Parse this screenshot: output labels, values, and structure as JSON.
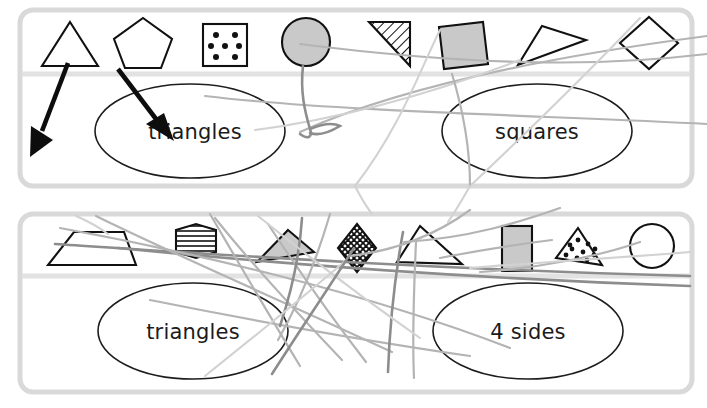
{
  "activity": {
    "title": "Shape sorting activity",
    "panel_count": 2,
    "colors": {
      "panel_border": "#d9d9d9",
      "panel_divider": "#e2e2e2",
      "shape_outline": "#111111",
      "shape_fill_gray": "#c9c9c9",
      "zone_outline": "#1d1d1d",
      "drag_trail": "#b4b4b4",
      "arrow": "#0d0d0d",
      "background": "#ffffff",
      "label_text": "#1b1b1b"
    }
  },
  "panels": [
    {
      "id": "panel-top",
      "shape_tray": {
        "name": "shape-tray-top",
        "shapes": [
          {
            "name": "triangle",
            "fill": "white",
            "pattern": "none"
          },
          {
            "name": "pentagon",
            "fill": "white",
            "pattern": "none"
          },
          {
            "name": "square-dotted",
            "fill": "white",
            "pattern": "dots",
            "dot_count": 7
          },
          {
            "name": "circle-gray",
            "fill": "gray",
            "pattern": "solid"
          },
          {
            "name": "right-triangle-hatched",
            "fill": "white",
            "pattern": "diagonal-hatch"
          },
          {
            "name": "square-gray-tilted",
            "fill": "gray",
            "pattern": "solid"
          },
          {
            "name": "thin-triangle",
            "fill": "white",
            "pattern": "none"
          },
          {
            "name": "diamond",
            "fill": "white",
            "pattern": "none"
          }
        ]
      },
      "zones": [
        {
          "id": "zone-top-left",
          "label": "triangles"
        },
        {
          "id": "zone-top-right",
          "label": "squares"
        }
      ]
    },
    {
      "id": "panel-bottom",
      "shape_tray": {
        "name": "shape-tray-bottom",
        "shapes": [
          {
            "name": "trapezoid",
            "fill": "white",
            "pattern": "none"
          },
          {
            "name": "hexagon-striped",
            "fill": "white",
            "pattern": "horizontal-stripes"
          },
          {
            "name": "thin-triangle-gray",
            "fill": "gray",
            "pattern": "solid"
          },
          {
            "name": "rhombus-crosshatched",
            "fill": "white",
            "pattern": "cross-hatch"
          },
          {
            "name": "right-triangle",
            "fill": "white",
            "pattern": "none"
          },
          {
            "name": "rectangle-gray",
            "fill": "gray",
            "pattern": "solid"
          },
          {
            "name": "triangle-dotted",
            "fill": "white",
            "pattern": "dots",
            "dot_count": 10
          },
          {
            "name": "circle",
            "fill": "white",
            "pattern": "none"
          }
        ]
      },
      "zones": [
        {
          "id": "zone-bottom-left",
          "label": "triangles"
        },
        {
          "id": "zone-bottom-right",
          "label": "4 sides"
        }
      ]
    }
  ],
  "annotations": {
    "arrows": [
      {
        "name": "arrow-from-triangle",
        "direction": "down-left"
      },
      {
        "name": "arrow-to-triangles-zone",
        "direction": "down-right"
      }
    ],
    "drag_trails_visible": true
  }
}
